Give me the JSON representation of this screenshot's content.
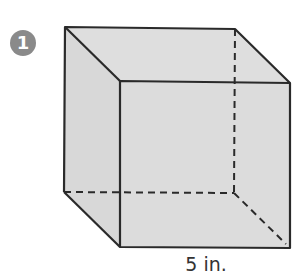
{
  "problem": {
    "number": "1",
    "badge_color": "#8a8a8a"
  },
  "figure": {
    "shape": "cube",
    "face_fill": "#dcdcdc",
    "edge_color": "#2a2a2a",
    "dimension_label": "5 in."
  }
}
